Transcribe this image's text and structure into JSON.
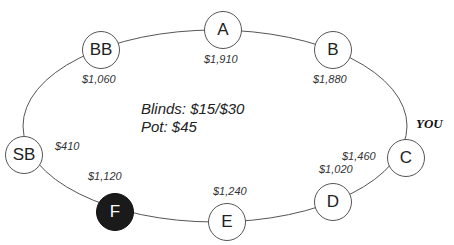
{
  "table": {
    "blinds": "Blinds: $15/$30",
    "pot": "Pot: $45",
    "you_label": "YOU"
  },
  "seats": [
    {
      "label": "A",
      "stack": "$1,910"
    },
    {
      "label": "B",
      "stack": "$1,880"
    },
    {
      "label": "C",
      "stack": "$1,460"
    },
    {
      "label": "D",
      "stack": "$1,020"
    },
    {
      "label": "E",
      "stack": "$1,240"
    },
    {
      "label": "F",
      "stack": "$1,120"
    },
    {
      "label": "SB",
      "stack": "$410"
    },
    {
      "label": "BB",
      "stack": "$1,060"
    }
  ],
  "colors": {
    "line": "#555555",
    "highlight_seat": "#1a1a1a"
  }
}
